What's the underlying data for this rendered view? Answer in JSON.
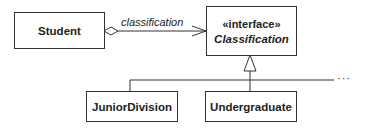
{
  "diagram": {
    "type": "uml-class",
    "classes": [
      {
        "id": "student",
        "name": "Student"
      },
      {
        "id": "classification",
        "stereotype": "«interface»",
        "name": "Classification",
        "abstract": true
      },
      {
        "id": "junior",
        "name": "JuniorDivision"
      },
      {
        "id": "undergrad",
        "name": "Undergraduate"
      }
    ],
    "association": {
      "from": "Student",
      "to": "Classification",
      "role": "classification",
      "kind": "aggregation-navigable"
    },
    "generalization": {
      "parent": "Classification",
      "children": [
        "JuniorDivision",
        "Undergraduate"
      ],
      "continuation": "···"
    }
  }
}
